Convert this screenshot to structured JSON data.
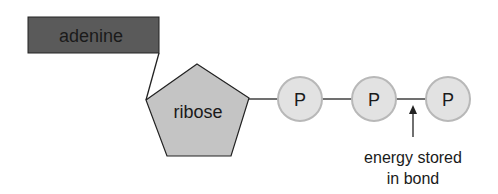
{
  "diagram": {
    "adenine": {
      "label": "adenine",
      "fill": "#5a5a5a"
    },
    "ribose": {
      "label": "ribose",
      "fill": "#c4c4c4"
    },
    "phosphates": [
      {
        "label": "P"
      },
      {
        "label": "P"
      },
      {
        "label": "P"
      }
    ],
    "phosphate_fill": "#e2e2e2",
    "phosphate_stroke": "#b8b8b8",
    "annotation": {
      "line1": "energy stored",
      "line2": "in bond"
    }
  }
}
